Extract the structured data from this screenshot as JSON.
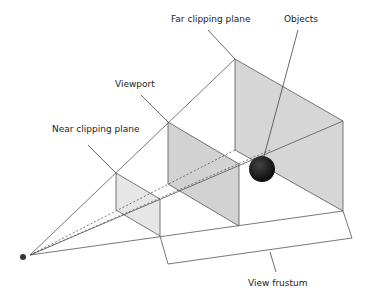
{
  "diagram": {
    "labels": {
      "far_clipping_plane": "Far clipping plane",
      "objects": "Objects",
      "viewport": "Viewport",
      "near_clipping_plane": "Near clipping plane",
      "view_frustum": "View frustum"
    },
    "colors": {
      "plane_fill": "#d6d6d6",
      "near_fill": "#e4e4e4",
      "line": "#555555",
      "object": "#1a1a1a"
    }
  }
}
